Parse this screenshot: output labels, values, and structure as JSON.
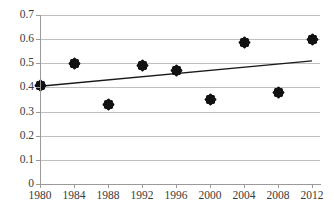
{
  "chart_data": {
    "type": "scatter",
    "title": "",
    "xlabel": "",
    "ylabel": "",
    "grid": true,
    "legend": "none",
    "xlim": [
      1980,
      2012
    ],
    "ylim": [
      0,
      0.7
    ],
    "x_tick_labels": [
      "1980",
      "1984",
      "1988",
      "1992",
      "1996",
      "2000",
      "2004",
      "2008",
      "2012"
    ],
    "y_tick_labels": [
      "0",
      "0.1",
      "0.2",
      "0.3",
      "0.4",
      "0.5",
      "0.6",
      "0.7"
    ],
    "y_ticks": [
      0,
      0.1,
      0.2,
      0.3,
      0.4,
      0.5,
      0.6,
      0.7
    ],
    "x": [
      1980,
      1984,
      1988,
      1992,
      1996,
      2000,
      2004,
      2008,
      2012
    ],
    "series": [
      {
        "name": "data points",
        "marker": "diamond",
        "color": "#111111",
        "values": [
          0.41,
          0.5,
          0.33,
          0.49,
          0.47,
          0.35,
          0.585,
          0.38,
          0.6
        ]
      },
      {
        "name": "linear trend",
        "type": "line",
        "color": "#1a1a1a",
        "endpoints": [
          {
            "x": 1980,
            "y": 0.405
          },
          {
            "x": 2012,
            "y": 0.51
          }
        ]
      }
    ],
    "colors": {
      "marker": "#111111",
      "trendline": "#1a1a1a",
      "gridline": "#bfbfbf",
      "axis": "#9a9a9a",
      "text": "#3a3a3a",
      "background": "#ffffff"
    }
  }
}
